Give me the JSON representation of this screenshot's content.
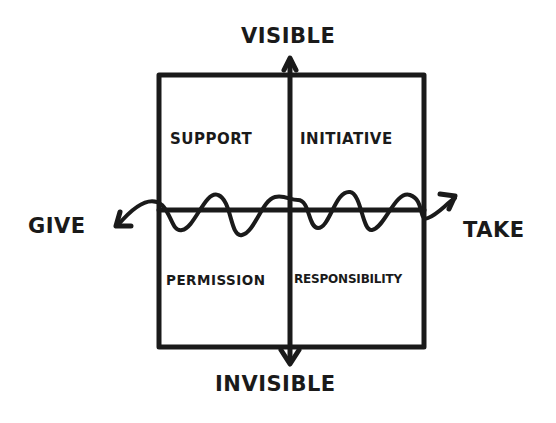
{
  "diagram": {
    "axes": {
      "top": "VISIBLE",
      "bottom": "INVISIBLE",
      "left": "GIVE",
      "right": "TAKE"
    },
    "quadrants": {
      "top_left": "SUPPORT",
      "top_right": "INITIATIVE",
      "bottom_left": "PERMISSION",
      "bottom_right": "RESPONSIBILITY"
    },
    "colors": {
      "ink": "#1a1a1a",
      "background": "#ffffff"
    }
  }
}
